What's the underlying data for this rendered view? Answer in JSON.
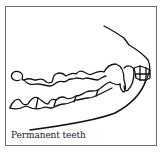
{
  "figure": {
    "caption": "Permanent teeth",
    "colors": {
      "line": "#111111",
      "border": "#6a6a6a",
      "background": "#ffffff"
    }
  }
}
